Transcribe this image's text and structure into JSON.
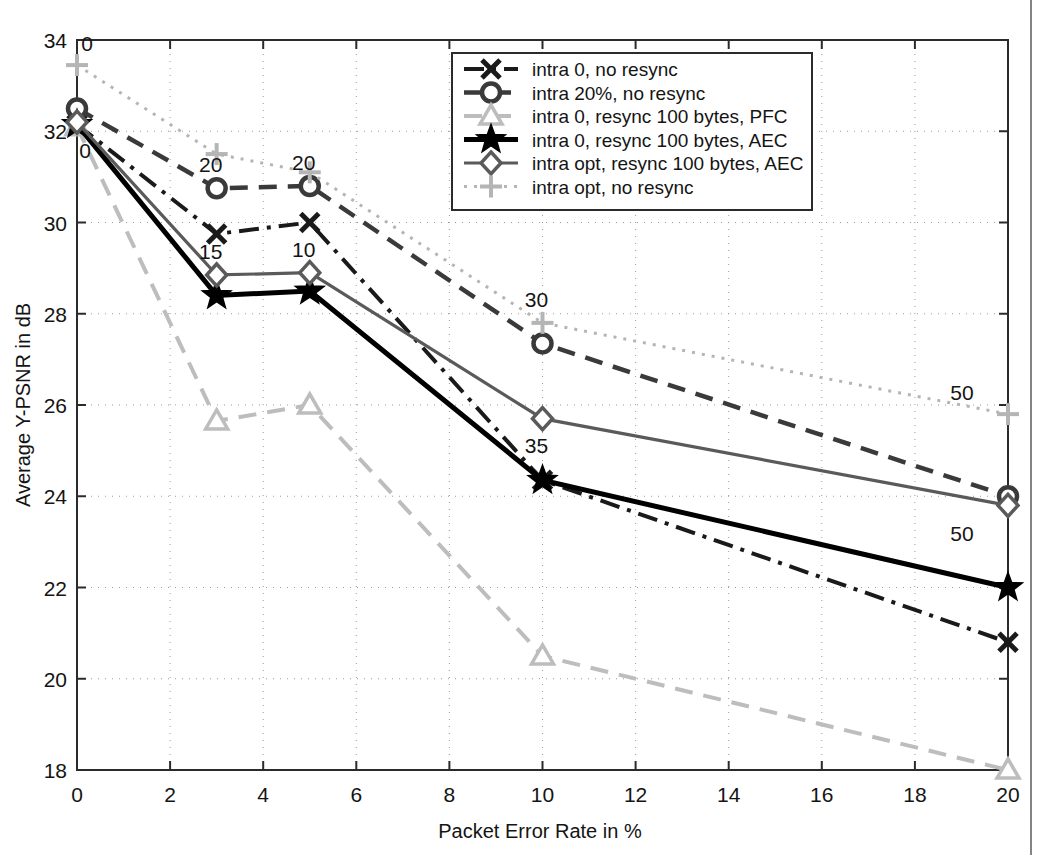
{
  "chart_data": {
    "type": "line",
    "title": "",
    "xlabel": "Packet Error Rate in %",
    "ylabel": "Average Y-PSNR in dB",
    "xlim": [
      0,
      20
    ],
    "ylim": [
      18,
      34
    ],
    "xticks": [
      "0",
      "2",
      "4",
      "6",
      "8",
      "10",
      "12",
      "14",
      "16",
      "18",
      "20"
    ],
    "yticks": [
      "18",
      "20",
      "22",
      "24",
      "26",
      "28",
      "30",
      "32",
      "34"
    ],
    "grid": "dotted",
    "legend_position": "top-right-inside",
    "x": [
      0,
      3,
      5,
      10,
      20
    ],
    "series": [
      {
        "name": "intra 0, no resync",
        "marker": "x-marker",
        "color": "#1a1a1a",
        "style": "dashdot",
        "values": [
          32.15,
          29.75,
          30.0,
          24.35,
          20.8
        ]
      },
      {
        "name": "intra 20%, no resync",
        "marker": "circle-marker",
        "color": "#3a3a3a",
        "style": "dashed",
        "values": [
          32.5,
          30.75,
          30.8,
          27.35,
          24.0
        ]
      },
      {
        "name": "intra 0, resync 100 bytes, PFC",
        "marker": "triangle-marker",
        "color": "#bdbdbd",
        "style": "dashed",
        "values": [
          32.1,
          25.65,
          26.0,
          20.5,
          18.0
        ]
      },
      {
        "name": "intra 0, resync 100 bytes, AEC",
        "marker": "star-marker",
        "color": "#000000",
        "style": "solid",
        "values": [
          32.15,
          28.4,
          28.5,
          24.35,
          22.0
        ]
      },
      {
        "name": "intra opt, resync 100 bytes, AEC",
        "marker": "diamond-marker",
        "color": "#5a5a5a",
        "style": "solid",
        "values": [
          32.2,
          28.85,
          28.9,
          25.7,
          23.8
        ]
      },
      {
        "name": "intra opt, no resync",
        "marker": "plus-marker",
        "color": "#b5b5b5",
        "style": "dotted",
        "values": [
          33.45,
          31.5,
          31.1,
          27.8,
          25.8
        ]
      }
    ],
    "annotations": [
      {
        "text": "0",
        "x": 0,
        "y": 33.45,
        "dx": 10,
        "dy": -14
      },
      {
        "text": "0",
        "x": 0,
        "y": 32.15,
        "dx": 8,
        "dy": 34
      },
      {
        "text": "20",
        "x": 3,
        "y": 30.75,
        "dx": -6,
        "dy": -16
      },
      {
        "text": "20",
        "x": 5,
        "y": 30.8,
        "dx": -6,
        "dy": -16
      },
      {
        "text": "15",
        "x": 3,
        "y": 28.85,
        "dx": -6,
        "dy": -16
      },
      {
        "text": "10",
        "x": 5,
        "y": 28.9,
        "dx": -6,
        "dy": -16
      },
      {
        "text": "30",
        "x": 10,
        "y": 27.8,
        "dx": -6,
        "dy": -16
      },
      {
        "text": "35",
        "x": 10,
        "y": 25.7,
        "dx": -6,
        "dy": 34
      },
      {
        "text": "50",
        "x": 20,
        "y": 25.8,
        "dx": -46,
        "dy": -14
      },
      {
        "text": "50",
        "x": 20,
        "y": 23.8,
        "dx": -46,
        "dy": 36
      }
    ]
  },
  "legend": {
    "items": [
      {
        "label": "intra 0, no resync"
      },
      {
        "label": "intra 20%, no resync"
      },
      {
        "label": "intra 0, resync 100 bytes, PFC"
      },
      {
        "label": "intra 0, resync 100 bytes, AEC"
      },
      {
        "label": "intra opt, resync 100 bytes, AEC"
      },
      {
        "label": "intra opt, no resync"
      }
    ]
  },
  "axes": {
    "x_label": "Packet Error Rate in %",
    "y_label": "Average Y-PSNR in dB",
    "x_ticks": [
      "0",
      "2",
      "4",
      "6",
      "8",
      "10",
      "12",
      "14",
      "16",
      "18",
      "20"
    ],
    "y_ticks": [
      "34",
      "32",
      "30",
      "28",
      "26",
      "24",
      "22",
      "20",
      "18"
    ]
  },
  "colors": {
    "black": "#000000",
    "dark_gray": "#3a3a3a",
    "mid_gray": "#5a5a5a",
    "light_gray": "#bdbdbd",
    "axis": "#333333"
  }
}
